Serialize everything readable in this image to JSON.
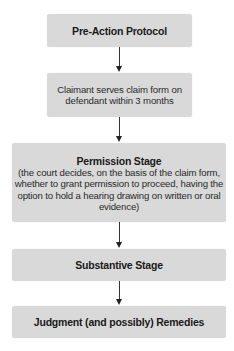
{
  "diagram": {
    "type": "flowchart",
    "direction": "top-to-bottom",
    "box_color": "#d9d9d9",
    "nodes": [
      {
        "id": "pre-action",
        "title": "Pre-Action Protocol"
      },
      {
        "id": "claim-form",
        "lines": [
          "Claimant serves claim form on",
          "defendant within 3 months"
        ]
      },
      {
        "id": "permission",
        "title": "Permission Stage",
        "lines": [
          "(the court decides, on the basis of the claim form,",
          "whether to grant permission to proceed, having the",
          "option to hold a hearing drawing on written or oral",
          "evidence)"
        ]
      },
      {
        "id": "substantive",
        "title": "Substantive Stage"
      },
      {
        "id": "judgment",
        "title": "Judgment (and possibly) Remedies"
      }
    ],
    "edges": [
      [
        "pre-action",
        "claim-form"
      ],
      [
        "claim-form",
        "permission"
      ],
      [
        "permission",
        "substantive"
      ],
      [
        "substantive",
        "judgment"
      ]
    ]
  }
}
